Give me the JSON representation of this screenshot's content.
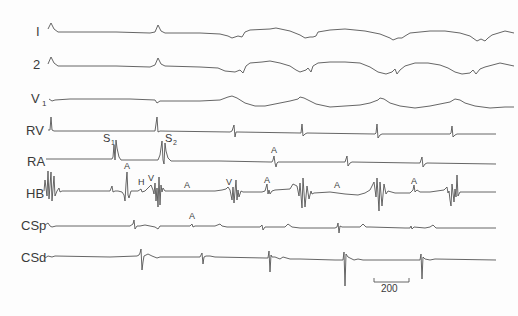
{
  "figure": {
    "type": "intracardiac electrogram tracing",
    "channels": [
      {
        "label": "I",
        "sub": ""
      },
      {
        "label": "2",
        "sub": ""
      },
      {
        "label": "V",
        "sub": "1"
      },
      {
        "label": "RV",
        "sub": ""
      },
      {
        "label": "RA",
        "sub": ""
      },
      {
        "label": "HB",
        "sub": ""
      },
      {
        "label": "CSp",
        "sub": ""
      },
      {
        "label": "CSd",
        "sub": ""
      }
    ],
    "stimuli": [
      {
        "label": "S",
        "sub": "1"
      },
      {
        "label": "S",
        "sub": "2"
      }
    ],
    "annotations": {
      "ra": [
        "A"
      ],
      "hb": [
        "A",
        "H",
        "V",
        "A",
        "V",
        "A",
        "A",
        "A"
      ],
      "csp": [
        "A"
      ]
    },
    "scale_bar": {
      "label": "200"
    }
  }
}
